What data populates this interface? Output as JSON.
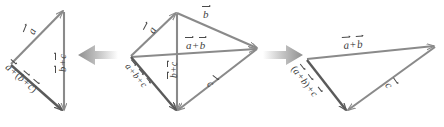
{
  "figure": {
    "equation": "a + (b + c) = (a + b) + c",
    "stroke_color": "#7d7d7d",
    "label_color": "#3f3f3f",
    "arrow_color": "#b0b0b0",
    "background": "#ffffff"
  },
  "panels": [
    {
      "id": "left",
      "name": "a-plus-quantity-b-plus-c",
      "labels": [
        {
          "id": "a",
          "text": "a",
          "kind": "vector",
          "rotation": -68,
          "x": 26,
          "y": 36
        },
        {
          "id": "bc",
          "text": "b + c",
          "kind": "vector-sum",
          "rotation": -90,
          "x": 59,
          "y": 59
        },
        {
          "id": "abc",
          "text": "a + (b + c)",
          "kind": "vector-sum-paren",
          "rotation": 59,
          "x": 14,
          "y": 62
        }
      ]
    },
    {
      "id": "middle",
      "name": "combined-parallelogram",
      "labels": [
        {
          "id": "a",
          "text": "a",
          "kind": "vector",
          "rotation": -62,
          "x": 146,
          "y": 33
        },
        {
          "id": "b",
          "text": "b",
          "kind": "vector",
          "rotation": 0,
          "x": 203,
          "y": 9
        },
        {
          "id": "ab",
          "text": "a + b",
          "kind": "vector-sum",
          "rotation": 0,
          "x": 186,
          "y": 41
        },
        {
          "id": "bc",
          "text": "b + c",
          "kind": "vector-sum",
          "rotation": -90,
          "x": 171,
          "y": 65
        },
        {
          "id": "c",
          "text": "c",
          "kind": "vector",
          "rotation": 38,
          "x": 212,
          "y": 80
        },
        {
          "id": "abc",
          "text": "a + b + c",
          "kind": "vector-sum",
          "rotation": 62,
          "x": 135,
          "y": 70
        }
      ]
    },
    {
      "id": "right",
      "name": "quantity-a-plus-b-plus-c",
      "labels": [
        {
          "id": "ab",
          "text": "a + b",
          "kind": "vector-sum",
          "rotation": -4,
          "x": 343,
          "y": 41
        },
        {
          "id": "abc",
          "text": "(a + b) + c",
          "kind": "vector-sum-paren",
          "rotation": 62,
          "x": 299,
          "y": 68
        },
        {
          "id": "c",
          "text": "c",
          "kind": "vector",
          "rotation": 60,
          "x": 392,
          "y": 83
        }
      ]
    }
  ],
  "connectors": [
    {
      "id": "arrow-left",
      "direction": "left",
      "x": 78,
      "y": 55
    },
    {
      "id": "arrow-right",
      "direction": "right",
      "x": 266,
      "y": 55
    }
  ],
  "glyphs": {
    "plus": "+",
    "lparen": "(",
    "rparen": ")"
  }
}
